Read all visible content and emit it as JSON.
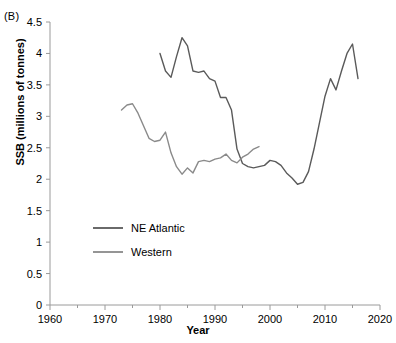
{
  "figure": {
    "panel_label": "(B)",
    "xlabel": "Year",
    "ylabel": "SSB (millions of tonnes)"
  },
  "colors": {
    "ne_atlantic": "#5a5a5a",
    "western": "#8a8a8a",
    "axis": "#9a9a9a",
    "text": "#000000"
  },
  "chart_data": {
    "type": "line",
    "title": "",
    "xlabel": "Year",
    "ylabel": "SSB (millions of tonnes)",
    "xlim": [
      1960,
      2020
    ],
    "ylim": [
      0,
      4.5
    ],
    "xticks": [
      1960,
      1970,
      1980,
      1990,
      2000,
      2010,
      2020
    ],
    "xticks_minor": [
      1965,
      1975,
      1985,
      1995,
      2005,
      2015
    ],
    "yticks": [
      0,
      0.5,
      1,
      1.5,
      2,
      2.5,
      3,
      3.5,
      4,
      4.5
    ],
    "grid": false,
    "legend_position": "center-left",
    "series": [
      {
        "name": "NE Atlantic",
        "color": "#5a5a5a",
        "x": [
          1980,
          1981,
          1982,
          1983,
          1984,
          1985,
          1986,
          1987,
          1988,
          1989,
          1990,
          1991,
          1992,
          1993,
          1994,
          1995,
          1996,
          1997,
          1998,
          1999,
          2000,
          2001,
          2002,
          2003,
          2004,
          2005,
          2006,
          2007,
          2008,
          2009,
          2010,
          2011,
          2012,
          2013,
          2014,
          2015,
          2016
        ],
        "y": [
          4.0,
          3.72,
          3.62,
          3.95,
          4.25,
          4.12,
          3.72,
          3.7,
          3.72,
          3.6,
          3.56,
          3.3,
          3.3,
          3.1,
          2.48,
          2.25,
          2.2,
          2.18,
          2.2,
          2.22,
          2.3,
          2.28,
          2.22,
          2.1,
          2.02,
          1.92,
          1.95,
          2.12,
          2.48,
          2.9,
          3.32,
          3.6,
          3.42,
          3.72,
          4.0,
          4.15,
          3.6
        ]
      },
      {
        "name": "Western",
        "color": "#8a8a8a",
        "x": [
          1973,
          1974,
          1975,
          1976,
          1977,
          1978,
          1979,
          1980,
          1981,
          1982,
          1983,
          1984,
          1985,
          1986,
          1987,
          1988,
          1989,
          1990,
          1991,
          1992,
          1993,
          1994,
          1995,
          1996,
          1997,
          1998
        ],
        "y": [
          3.1,
          3.18,
          3.2,
          3.05,
          2.85,
          2.65,
          2.6,
          2.62,
          2.75,
          2.42,
          2.2,
          2.08,
          2.18,
          2.1,
          2.28,
          2.3,
          2.28,
          2.32,
          2.34,
          2.4,
          2.3,
          2.26,
          2.35,
          2.4,
          2.48,
          2.52
        ]
      }
    ],
    "legend": [
      {
        "label": "NE Atlantic",
        "color": "#5a5a5a"
      },
      {
        "label": "Western",
        "color": "#8a8a8a"
      }
    ]
  }
}
